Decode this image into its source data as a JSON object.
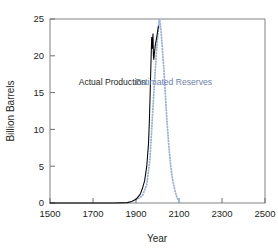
{
  "chart_data": {
    "type": "line",
    "title": "",
    "xlabel": "Year",
    "ylabel": "Billion Barrels",
    "xlim": [
      1500,
      2500
    ],
    "ylim": [
      0,
      25
    ],
    "xticks": [
      1500,
      1700,
      1900,
      2100,
      2300,
      2500
    ],
    "xtick_labels": [
      "1500",
      "1700",
      "1900",
      "2100",
      "2300",
      "2500"
    ],
    "yticks": [
      0,
      5,
      10,
      15,
      20,
      25
    ],
    "ytick_labels": [
      "0",
      "5",
      "10",
      "15",
      "20",
      "25"
    ],
    "grid": false,
    "legend_position": "inline-annotations",
    "series": [
      {
        "name": "Actual Production",
        "style": "solid",
        "color": "#000000",
        "label_x": 1790,
        "label_y": 16.0,
        "x": [
          1500,
          1700,
          1800,
          1860,
          1880,
          1900,
          1920,
          1930,
          1940,
          1950,
          1958,
          1962,
          1966,
          1970,
          1973,
          1975,
          1977,
          1979,
          1981,
          1983,
          1985,
          1990,
          1995,
          2000,
          2004
        ],
        "y": [
          0,
          0,
          0,
          0.05,
          0.2,
          0.5,
          1.2,
          2.0,
          3.0,
          5.0,
          8.0,
          11.0,
          15.0,
          19.5,
          22.5,
          21.0,
          22.0,
          23.0,
          20.0,
          19.5,
          20.2,
          21.5,
          22.3,
          23.2,
          24.0
        ]
      },
      {
        "name": "Estimated Reserves",
        "style": "dotted",
        "color": "#9fb4d4",
        "label_x": 2075,
        "label_y": 16.0,
        "x": [
          1900,
          1930,
          1950,
          1965,
          1975,
          1985,
          1995,
          2002,
          2008,
          2012,
          2016,
          2020,
          2025,
          2030,
          2035,
          2040,
          2045,
          2050,
          2055,
          2060,
          2065,
          2070,
          2080,
          2090,
          2100
        ],
        "y": [
          0.4,
          1.0,
          2.5,
          6.0,
          11.0,
          16.0,
          20.5,
          23.0,
          25.0,
          24.6,
          23.5,
          22.0,
          20.0,
          18.0,
          15.5,
          13.0,
          10.8,
          8.8,
          7.0,
          5.5,
          4.2,
          3.2,
          1.8,
          0.8,
          0.2
        ]
      }
    ],
    "annotations": [
      {
        "text": "Actual Production",
        "color": "#231f20"
      },
      {
        "text": "Estimated Reserves",
        "color": "#6a7fa8"
      }
    ]
  },
  "colors": {
    "axis": "#6d6e70",
    "frame": "#808285",
    "actual_production": "#000000",
    "estimated_reserves": "#9fb4d4",
    "estimated_reserves_label": "#6a7fa8",
    "text": "#231f20",
    "background": "#ffffff"
  }
}
